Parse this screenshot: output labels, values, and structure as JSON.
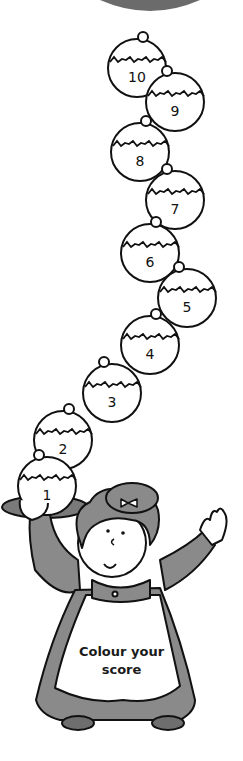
{
  "worksheet": {
    "instruction_line1": "Colour your",
    "instruction_line2": "score",
    "colors": {
      "outline": "#111111",
      "dress": "#8a8a8a",
      "dress_shade": "#6e6e6e",
      "top_disc": "#6b6b6b",
      "fill": "#ffffff"
    }
  },
  "puddings": [
    {
      "label": "1",
      "cx": 47,
      "cy": 486
    },
    {
      "label": "2",
      "cx": 63,
      "cy": 440
    },
    {
      "label": "3",
      "cx": 112,
      "cy": 393
    },
    {
      "label": "4",
      "cx": 150,
      "cy": 345
    },
    {
      "label": "5",
      "cx": 187,
      "cy": 298
    },
    {
      "label": "6",
      "cx": 150,
      "cy": 253
    },
    {
      "label": "7",
      "cx": 175,
      "cy": 200
    },
    {
      "label": "8",
      "cx": 140,
      "cy": 152
    },
    {
      "label": "9",
      "cx": 175,
      "cy": 102
    },
    {
      "label": "10",
      "cx": 137,
      "cy": 68
    }
  ]
}
